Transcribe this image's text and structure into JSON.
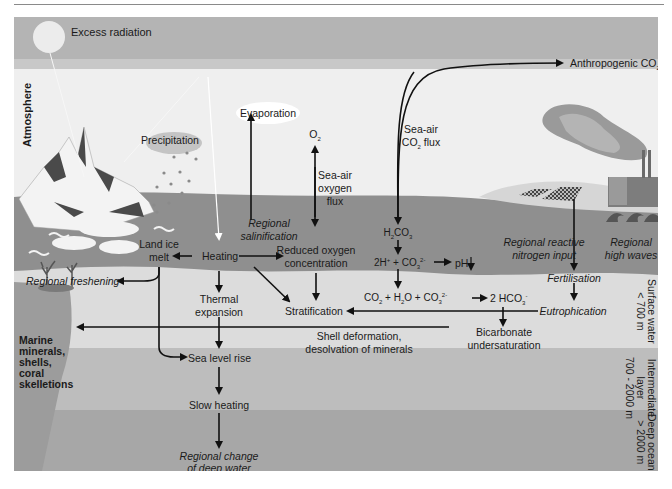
{
  "title_bar": {
    "label": "Excess radiation"
  },
  "zones": {
    "atmosphere": "Atmosphere",
    "surface": [
      "Surface water",
      "< 700 m"
    ],
    "intermediate": [
      "Intermediate",
      "layer",
      "700 - 2000 m"
    ],
    "deep": [
      "Deep ocean",
      "> 2000 m"
    ]
  },
  "atmosphere_labels": {
    "precipitation": "Precipitation",
    "evaporation": "Evaporation",
    "o2": "O",
    "o2_sub": "2",
    "sea_air_oxygen": [
      "Sea-air",
      "oxygen",
      "flux"
    ],
    "sea_air_co2_line1": "Sea-air",
    "sea_air_co2_line2_pre": "CO",
    "sea_air_co2_line2_sub": "2",
    "sea_air_co2_line2_post": " flux",
    "anthropogenic_pre": "Anthropogenic CO",
    "anthropogenic_sub": "2"
  },
  "surface_labels": {
    "regional_salinification": [
      "Regional",
      "salinification"
    ],
    "land_ice_melt": [
      "Land ice",
      "melt"
    ],
    "heating": "Heating",
    "reduced_oxygen": [
      "Reduced oxygen",
      "concentration"
    ],
    "h2co3": {
      "a": "H",
      "s1": "2",
      "b": "CO",
      "s2": "3"
    },
    "eq1": {
      "a": "2H",
      "sup1": "+",
      "b": " + CO",
      "sub1": "3",
      "sup2": "2-"
    },
    "ph": "pH",
    "ph_arrow": "↓",
    "regional_reactive": [
      "Regional reactive",
      "nitrogen input"
    ],
    "regional_high_waves": [
      "Regional",
      "high waves"
    ]
  },
  "subsurface_labels": {
    "regional_freshening": "Regional freshening",
    "thermal_expansion": [
      "Thermal",
      "expansion"
    ],
    "stratification": "Stratification",
    "eq2": {
      "a": "CO",
      "s1": "2",
      "b": " + H",
      "s2": "2",
      "c": "O + CO",
      "s3": "3",
      "sup3": "2-"
    },
    "eq2_product": {
      "a": "2 HCO",
      "s": "3",
      "sup": "-"
    },
    "fertilisation": "Fertilisation",
    "eutrophication": "Eutrophication",
    "bicarbonate": [
      "Bicarbonate",
      "undersaturation"
    ],
    "shell_deformation": [
      "Shell deformation,",
      "desolvation of minerals"
    ],
    "marine_minerals": [
      "Marine",
      "minerals,",
      "shells,",
      "coral",
      "skelletions"
    ],
    "sea_level_rise": "Sea level rise",
    "slow_heating": "Slow heating",
    "regional_change": [
      "Regional change",
      "of deep water"
    ]
  },
  "colors": {
    "sky_band": "#b4b4b4",
    "sky": "#efefef",
    "surface_band": "#8f8f8f",
    "surface_water": "#dcdcdc",
    "intermediate": "#bdbdbd",
    "deep": "#a7a7a7",
    "arrow": "#111111"
  }
}
